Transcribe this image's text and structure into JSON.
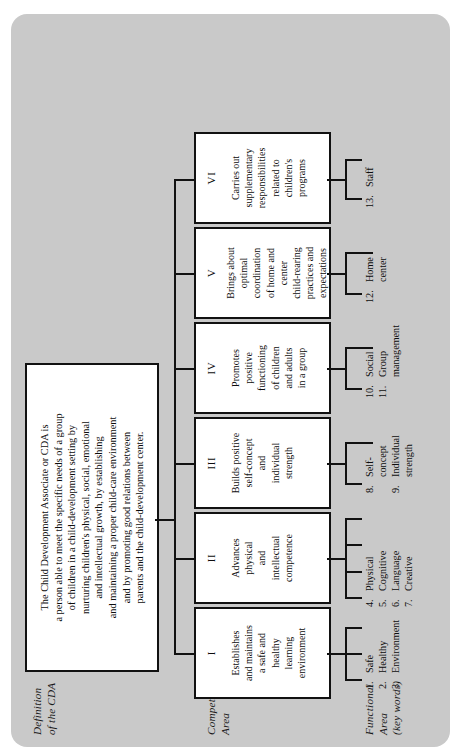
{
  "meta": {
    "background_color": "#c9c9c9",
    "box_fill": "#ffffff",
    "line_color": "#111111",
    "orientation": "rotated-90-counterclockwise"
  },
  "row_labels": {
    "definition": "Definition\nof the CDA",
    "definition_line1": "Definition",
    "definition_line2": "of the CDA",
    "competency_line1": "Competency",
    "competency_line2": "Area",
    "functional_line1": "Functional",
    "functional_line2": "Area",
    "functional_line3": "(key words)"
  },
  "definition": {
    "text": "The Child Development Associate or CDA is a person able to meet the specific needs of a group of children in a child-development setting by nurturing children's physical, social, emotional and intellectual growth, by establishing and maintaining a proper child-care environment and by promoting good relations between parents and the child-development center.",
    "lines": [
      "The Child Development Associate or CDA is",
      "a person able to meet the specific needs of a group",
      "of children in a child-development setting by",
      "nurturing children's physical, social, emotional",
      "and intellectual growth, by establishing",
      "and maintaining a proper child-care environment",
      "and by promoting good relations between",
      "parents and the child-development center."
    ]
  },
  "competencies": [
    {
      "numeral": "I",
      "text": "Establishes and maintains a safe and healthy learning environment",
      "lines": [
        "Establishes",
        "and maintains",
        "a safe and",
        "healthy",
        "learning",
        "environment"
      ]
    },
    {
      "numeral": "II",
      "text": "Advances physical and intellectual competence",
      "lines": [
        "Advances",
        "physical",
        "and",
        "intellectual",
        "competence"
      ]
    },
    {
      "numeral": "III",
      "text": "Builds positive self-concept and individual strength",
      "lines": [
        "Builds positive",
        "self-concept",
        "and",
        "individual",
        "strength"
      ]
    },
    {
      "numeral": "IV",
      "text": "Promotes positive functioning of children and adults in a group",
      "lines": [
        "Promotes",
        "positive",
        "functioning",
        "of children",
        "and adults",
        "in a group"
      ]
    },
    {
      "numeral": "V",
      "text": "Brings about optimal coordination of home and center child-rearing practices and expectations",
      "lines": [
        "Brings about",
        "optimal",
        "coordination",
        "of home and",
        "center",
        "child-rearing",
        "practices and",
        "expectations"
      ]
    },
    {
      "numeral": "VI",
      "text": "Carries out supplementary responsibilities related to children's programs",
      "lines": [
        "Carries out",
        "supplementary",
        "responsibilities",
        "related to",
        "children's",
        "programs"
      ]
    }
  ],
  "functional_areas": [
    {
      "group": 1,
      "items": [
        {
          "num": "1.",
          "label": "Safe",
          "cont": ""
        },
        {
          "num": "2.",
          "label": "Healthy",
          "cont": ""
        },
        {
          "num": "3.",
          "label": "Environment",
          "cont": ""
        }
      ]
    },
    {
      "group": 2,
      "items": [
        {
          "num": "4.",
          "label": "Physical",
          "cont": ""
        },
        {
          "num": "5.",
          "label": "Cognitive",
          "cont": ""
        },
        {
          "num": "6.",
          "label": "Language",
          "cont": ""
        },
        {
          "num": "7.",
          "label": "Creative",
          "cont": ""
        }
      ]
    },
    {
      "group": 3,
      "items": [
        {
          "num": "8.",
          "label": "Self-",
          "cont": "concept"
        },
        {
          "num": "9.",
          "label": "Individual",
          "cont": "strength"
        }
      ]
    },
    {
      "group": 4,
      "items": [
        {
          "num": "10.",
          "label": "Social",
          "cont": ""
        },
        {
          "num": "11.",
          "label": "Group",
          "cont": "management"
        }
      ]
    },
    {
      "group": 5,
      "items": [
        {
          "num": "12.",
          "label": "Home",
          "cont": "center"
        }
      ]
    },
    {
      "group": 6,
      "items": [
        {
          "num": "13.",
          "label": "Staff",
          "cont": ""
        }
      ]
    }
  ]
}
